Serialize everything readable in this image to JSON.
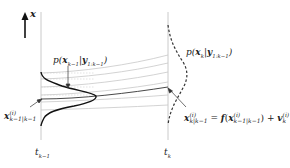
{
  "figure": {
    "axis_label": "x",
    "time_labels": {
      "left": "t",
      "left_sub": "k−1",
      "right": "t",
      "right_sub": "k"
    },
    "posterior_label": {
      "p": "p(",
      "x": "x",
      "x_sub": "k−1",
      "bar": "|",
      "y": "y",
      "y_sub": "1:k−1",
      "close": ")"
    },
    "prior_label": {
      "p": "p(",
      "x": "x",
      "x_sub": "k",
      "bar": "|",
      "y": "y",
      "y_sub": "1:k−1",
      "close": ")"
    },
    "particle_label": {
      "x": "x",
      "sup": "(i)",
      "sub": "k−1|k−1"
    },
    "prediction_equation": {
      "lhs_x": "x",
      "lhs_sup": "(i)",
      "lhs_sub": "k|k−1",
      "eq": " = ",
      "f": "f",
      "open": "(",
      "arg_x": "x",
      "arg_sup": "(i)",
      "arg_sub": "k−1|k−1",
      "close": ")",
      "plus": " + ",
      "v": "v",
      "v_sup": "(i)",
      "v_sub": "k"
    },
    "colors": {
      "curve": "#1a1a1a",
      "guide": "#bdbdbd",
      "trajectory": "#c8c8c8"
    }
  }
}
